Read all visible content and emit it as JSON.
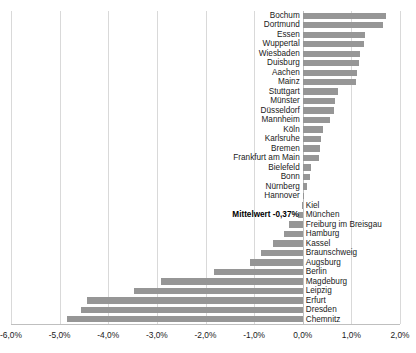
{
  "chart_data": {
    "type": "bar",
    "orientation": "horizontal",
    "title": "",
    "xlabel": "",
    "ylabel": "",
    "xlim": [
      -6.0,
      2.0
    ],
    "grid": true,
    "legend": false,
    "bar_color": "#969696",
    "gridline_color": "#d9d9d9",
    "xticks": [
      "-6,0%",
      "-5,0%",
      "-4,0%",
      "-3,0%",
      "-2,0%",
      "-1,0%",
      "0,0%",
      "1,0%",
      "2,0%"
    ],
    "xtick_values": [
      -6.0,
      -5.0,
      -4.0,
      -3.0,
      -2.0,
      -1.0,
      0.0,
      1.0,
      2.0
    ],
    "categories": [
      "Bochum",
      "Dortmund",
      "Essen",
      "Wuppertal",
      "Wiesbaden",
      "Duisburg",
      "Aachen",
      "Mainz",
      "Stuttgart",
      "Münster",
      "Düsseldorf",
      "Mannheim",
      "Köln",
      "Karlsruhe",
      "Bremen",
      "Frankfurt am Main",
      "Bielefeld",
      "Bonn",
      "Nürnberg",
      "Hannover",
      "Kiel",
      "München",
      "Freiburg im Breisgau",
      "Hamburg",
      "Kassel",
      "Braunschweig",
      "Augsburg",
      "Berlin",
      "Magdeburg",
      "Leipzig",
      "Erfurt",
      "Dresden",
      "Chemnitz"
    ],
    "values": [
      1.72,
      1.66,
      1.28,
      1.25,
      1.18,
      1.16,
      1.12,
      1.1,
      0.73,
      0.67,
      0.65,
      0.56,
      0.42,
      0.38,
      0.35,
      0.33,
      0.16,
      0.15,
      0.09,
      0.01,
      -0.01,
      -0.1,
      -0.28,
      -0.38,
      -0.62,
      -0.86,
      -1.08,
      -1.82,
      -2.92,
      -3.48,
      -4.44,
      -4.56,
      -4.84
    ],
    "annotation": {
      "text": "Mittelwert -0,37%",
      "value": -0.37,
      "bold": true
    }
  }
}
